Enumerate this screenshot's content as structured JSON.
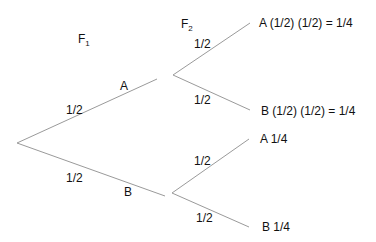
{
  "diagram": {
    "type": "probability-tree",
    "line_color": "#9a9a9a",
    "generations": {
      "f1": {
        "base": "F",
        "sub": "1"
      },
      "f2": {
        "base": "F",
        "sub": "2"
      }
    },
    "first_level": {
      "upper": {
        "label": "A",
        "prob": "1/2"
      },
      "lower": {
        "label": "B",
        "prob": "1/2"
      }
    },
    "second_level": {
      "from_a": {
        "upper": {
          "prob": "1/2",
          "outcome": "A (1/2) (1/2) = 1/4"
        },
        "lower": {
          "prob": "1/2",
          "outcome": "B (1/2) (1/2) = 1/4"
        }
      },
      "from_b": {
        "upper": {
          "prob": "1/2",
          "outcome": "A  1/4"
        },
        "lower": {
          "prob": "1/2",
          "outcome": "B  1/4"
        }
      }
    }
  }
}
